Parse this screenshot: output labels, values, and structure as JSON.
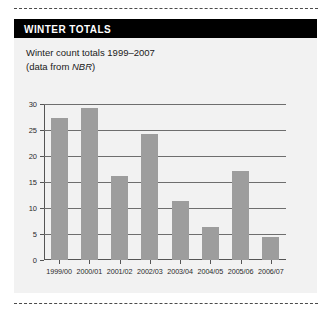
{
  "panel": {
    "title": "WINTER TOTALS",
    "caption_line1": "Winter count totals 1999–2007",
    "caption_line2_pre": "(data from ",
    "caption_line2_ital": "NBR",
    "caption_line2_post": ")"
  },
  "colors": {
    "header_bg": "#000000",
    "header_text": "#ffffff",
    "panel_bg": "#f2f2f2",
    "bar_fill": "#9d9d9d",
    "gridline": "#6e6e6e",
    "axis": "#555555"
  },
  "chart_data": {
    "type": "bar",
    "title": "Winter count totals 1999–2007",
    "subtitle": "(data from NBR)",
    "xlabel": "",
    "ylabel": "",
    "categories": [
      "1999/00",
      "2000/01",
      "2001/02",
      "2002/03",
      "2003/04",
      "2004/05",
      "2005/06",
      "2006/07"
    ],
    "values": [
      27.3,
      29.3,
      16.1,
      24.2,
      11.3,
      6.3,
      17.2,
      4.4
    ],
    "ylim": [
      0,
      30
    ],
    "yticks": [
      0,
      5,
      10,
      15,
      20,
      25,
      30
    ],
    "ytick_labels": [
      "0",
      "5",
      "10",
      "15",
      "20",
      "25",
      "30"
    ],
    "grid": true,
    "legend": false,
    "series": [
      {
        "name": "Winter count total",
        "values": [
          27.3,
          29.3,
          16.1,
          24.2,
          11.3,
          6.3,
          17.2,
          4.4
        ]
      }
    ]
  }
}
